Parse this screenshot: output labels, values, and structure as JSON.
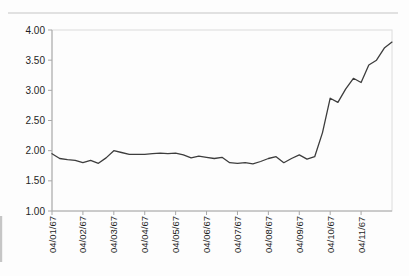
{
  "figure": {
    "width": 409,
    "height": 276,
    "background": "#fdfdfd",
    "line_color": "#3d3d3d",
    "axis_color": "#a8a8a8",
    "border_color": "#dcdcdc",
    "artifact_color": "#c6c6c6",
    "label_color": "#1f1f1f"
  },
  "chart_data": {
    "type": "line",
    "title": "",
    "xlabel": "",
    "ylabel": "",
    "x_tick_labels": [
      "04/01/67",
      "04/02/67",
      "04/03/67",
      "04/04/67",
      "04/05/67",
      "04/06/67",
      "04/07/67",
      "04/08/67",
      "04/09/67",
      "04/10/67",
      "04/11/67"
    ],
    "points_per_x_tick": 4,
    "y_tick_labels": [
      "4.00",
      "3.50",
      "3.00",
      "2.50",
      "2.00",
      "1.50",
      "1.00"
    ],
    "y_tick_values": [
      4.0,
      3.5,
      3.0,
      2.5,
      2.0,
      1.5,
      1.0
    ],
    "ylim": [
      1.0,
      4.0
    ],
    "grid": false,
    "legend": "none",
    "series": [
      {
        "values": [
          1.95,
          1.87,
          1.85,
          1.84,
          1.8,
          1.84,
          1.79,
          1.88,
          2.0,
          1.97,
          1.94,
          1.94,
          1.94,
          1.95,
          1.96,
          1.95,
          1.96,
          1.93,
          1.88,
          1.91,
          1.89,
          1.87,
          1.89,
          1.8,
          1.79,
          1.8,
          1.78,
          1.82,
          1.87,
          1.9,
          1.8,
          1.87,
          1.93,
          1.86,
          1.9,
          2.3,
          2.87,
          2.8,
          3.02,
          3.2,
          3.13,
          3.42,
          3.5,
          3.7,
          3.8
        ]
      }
    ]
  }
}
